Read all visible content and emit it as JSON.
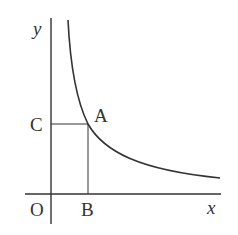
{
  "diagram": {
    "type": "hyperbola-graph",
    "axes": {
      "x_label": "x",
      "y_label": "y",
      "origin_label": "O"
    },
    "points": {
      "A": {
        "label": "A",
        "description": "point on curve"
      },
      "B": {
        "label": "B",
        "description": "foot of perpendicular from A to x-axis"
      },
      "C": {
        "label": "C",
        "description": "foot of perpendicular from A to y-axis"
      }
    },
    "colors": {
      "stroke": "#333333",
      "background": "#ffffff"
    }
  }
}
